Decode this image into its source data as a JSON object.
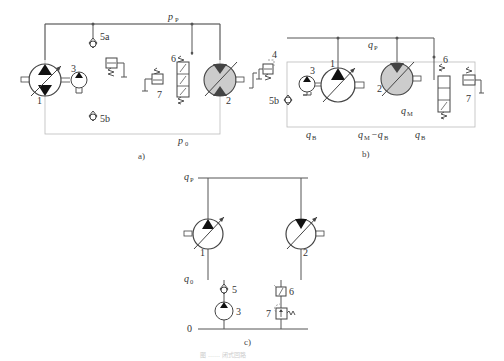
{
  "figure": {
    "caption": "图 …… 闭式回路",
    "panels": [
      {
        "id": "a",
        "caption": "a)",
        "labels": {
          "high_pressure": "p",
          "high_pressure_sub": "P",
          "low_pressure": "p",
          "low_pressure_sub": "0",
          "pump_main": "1",
          "motor": "2",
          "charge_pump": "3",
          "check_valve_a": "5a",
          "check_valve_b": "5b",
          "shuttle_valve": "6",
          "relief_valve": "7"
        }
      },
      {
        "id": "b",
        "caption": "b)",
        "labels": {
          "flow_pump": "q",
          "flow_pump_sub": "P",
          "flow_motor": "q",
          "flow_motor_sub": "M",
          "flow_left": "q",
          "flow_left_sub": "B",
          "flow_middle": "q",
          "flow_middle_sub_1": "M",
          "flow_middle_minus": "−q",
          "flow_middle_sub_2": "B",
          "flow_right": "q",
          "flow_right_sub": "B",
          "pump_main": "1",
          "motor": "2",
          "charge_pump": "3",
          "relief_valve_4": "4",
          "check_valve_b": "5b",
          "shuttle_valve": "6",
          "relief_valve": "7"
        }
      },
      {
        "id": "c",
        "caption": "c)",
        "labels": {
          "flow_top": "q",
          "flow_top_sub": "P",
          "flow_low": "q",
          "flow_low_sub": "0",
          "zero_line": "0",
          "pump_main": "1",
          "motor": "2",
          "charge_pump": "3",
          "check_valve": "5",
          "shuttle_valve": "6",
          "relief_valve": "7"
        }
      }
    ]
  },
  "colors": {
    "line": "#555555",
    "faint_line": "#bbbbbb",
    "motor_fill": "#cccccc",
    "triangle": "#111111"
  }
}
